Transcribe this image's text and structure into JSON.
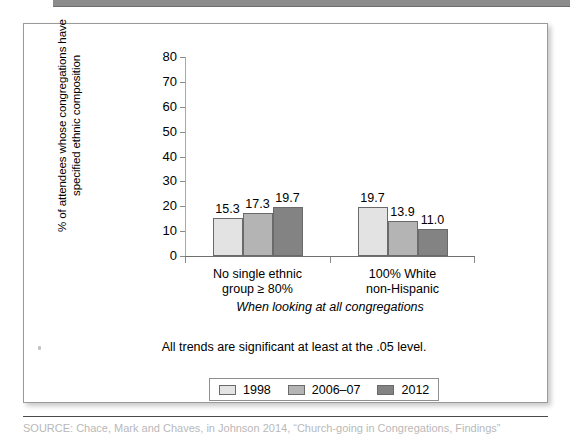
{
  "figure": {
    "note": "All trends are significant at least at the .05 level.",
    "source_caption": "SOURCE: Chace, Mark and Chaves, in Johnson 2014, “Church-going in Congregations, Findings”"
  },
  "chart_data": {
    "type": "bar",
    "title": "",
    "subtitle": "",
    "xlabel": "When looking at all congregations",
    "ylabel": "% of attendees whose congregations have specified ethnic composition",
    "categories": [
      "No single ethnic group ≥ 80%",
      "100% White non-Hispanic"
    ],
    "category_lines": [
      [
        "No single ethnic",
        "group ≥ 80%"
      ],
      [
        "100% White",
        "non-Hispanic"
      ]
    ],
    "series": [
      {
        "name": "1998",
        "values": [
          15.3,
          19.7
        ],
        "color": "#e3e3e3"
      },
      {
        "name": "2006–07",
        "values": [
          17.3,
          13.9
        ],
        "color": "#b4b4b4"
      },
      {
        "name": "2012",
        "values": [
          19.7,
          11.0
        ],
        "color": "#838383"
      }
    ],
    "value_labels": [
      [
        "15.3",
        "17.3",
        "19.7"
      ],
      [
        "19.7",
        "13.9",
        "11.0"
      ]
    ],
    "ylim": [
      0,
      80
    ],
    "yticks": [
      0,
      10,
      20,
      30,
      40,
      50,
      60,
      70,
      80
    ],
    "ytick_labels": [
      "0",
      "10",
      "20",
      "30",
      "40",
      "50",
      "60",
      "70",
      "80"
    ],
    "grid": false,
    "legend_position": "bottom",
    "legend_entries": [
      "1998",
      "2006–07",
      "2012"
    ]
  }
}
